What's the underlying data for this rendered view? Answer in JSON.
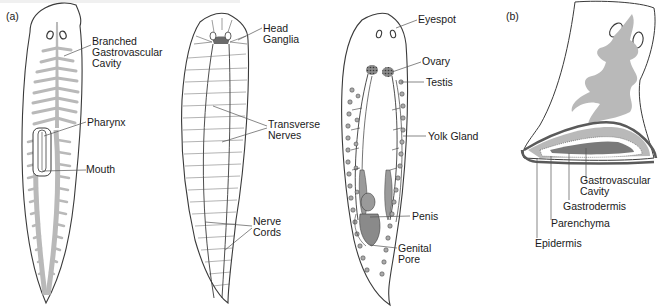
{
  "figure": {
    "panels": [
      {
        "tag": "(a)",
        "views": [
          {
            "name": "digestive-system",
            "labels": [
              "Branched Gastrovascular Cavity",
              "Pharynx",
              "Mouth"
            ]
          },
          {
            "name": "nervous-system",
            "labels": [
              "Head Ganglia",
              "Transverse Nerves",
              "Nerve Cords"
            ]
          },
          {
            "name": "reproductive-system",
            "labels": [
              "Eyespot",
              "Ovary",
              "Testis",
              "Yolk Gland",
              "Penis",
              "Genital Pore"
            ]
          }
        ]
      },
      {
        "tag": "(b)",
        "views": [
          {
            "name": "cross-section",
            "labels": [
              "Gastrovascular Cavity",
              "Gastrodermis",
              "Parenchyma",
              "Epidermis"
            ]
          }
        ]
      }
    ]
  },
  "labels": {
    "panel_a": "(a)",
    "panel_b": "(b)",
    "branched_1": "Branched",
    "branched_2": "Gastrovascular",
    "branched_3": "Cavity",
    "pharynx": "Pharynx",
    "mouth": "Mouth",
    "head_1": "Head",
    "head_2": "Ganglia",
    "transverse_1": "Transverse",
    "transverse_2": "Nerves",
    "nerve_1": "Nerve",
    "nerve_2": "Cords",
    "eyespot": "Eyespot",
    "ovary": "Ovary",
    "testis": "Testis",
    "yolk": "Yolk Gland",
    "penis": "Penis",
    "genital_1": "Genital",
    "genital_2": "Pore",
    "gv_1": "Gastrovascular",
    "gv_2": "Cavity",
    "gastrodermis": "Gastrodermis",
    "parenchyma": "Parenchyma",
    "epidermis": "Epidermis"
  },
  "colors": {
    "outline": "#3a3a3a",
    "gut_fill": "#b9b9b9",
    "dark_fill": "#7a7a7a",
    "leader": "#555555"
  }
}
